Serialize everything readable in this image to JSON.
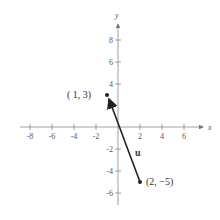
{
  "diagram": {
    "type": "vector-on-coordinate-plane",
    "axes": {
      "x_label": "x",
      "y_label": "y",
      "x_ticks": [
        "-8",
        "-6",
        "-4",
        "-2",
        "2",
        "4",
        "6"
      ],
      "y_ticks": [
        "8",
        "6",
        "4",
        "-2",
        "-4",
        "-6"
      ]
    },
    "vector": {
      "name": "u",
      "initial_point": {
        "label": "(-1, 3)",
        "x": -1,
        "y": 3
      },
      "terminal_point": {
        "label": "(2, -5)",
        "x": 2,
        "y": -5
      },
      "arrow_head_at": "initial_point"
    },
    "colors": {
      "axis": "#777777",
      "vector": "#222222",
      "text": "#444444"
    }
  },
  "labels": {
    "start_point": "( 1, 3)",
    "end_point": "(2,  −5)",
    "vector_name": "u",
    "x_axis": "x",
    "y_axis": "y"
  }
}
